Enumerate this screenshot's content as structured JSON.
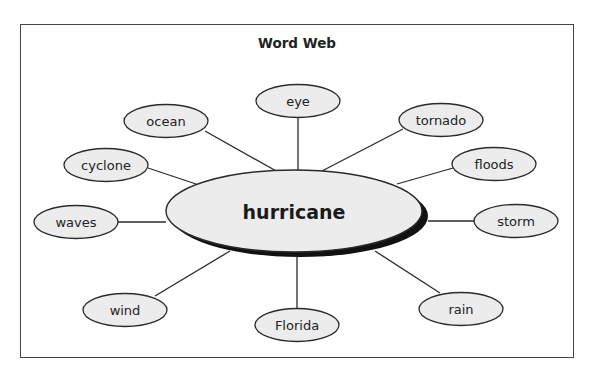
{
  "title": "Word Web",
  "center": {
    "label": "hurricane",
    "cx": 294,
    "cy": 211,
    "rx": 128,
    "ry": 41
  },
  "colors": {
    "fill": "#ececec",
    "stroke": "#2a2a2a",
    "shadow": "#111111",
    "frame": "#444444"
  },
  "nodes": [
    {
      "id": "eye",
      "label": "eye",
      "cx": 298,
      "cy": 101,
      "line": [
        298,
        117,
        298,
        170
      ]
    },
    {
      "id": "ocean",
      "label": "ocean",
      "cx": 166,
      "cy": 121,
      "line": [
        205,
        131,
        278,
        172
      ]
    },
    {
      "id": "tornado",
      "label": "tornado",
      "cx": 441,
      "cy": 120,
      "line": [
        403,
        129,
        320,
        172
      ]
    },
    {
      "id": "cyclone",
      "label": "cyclone",
      "cx": 106,
      "cy": 165,
      "line": [
        148,
        168,
        196,
        184
      ]
    },
    {
      "id": "floods",
      "label": "floods",
      "cx": 494,
      "cy": 164,
      "line": [
        453,
        168,
        397,
        184
      ]
    },
    {
      "id": "waves",
      "label": "waves",
      "cx": 76,
      "cy": 222,
      "line": [
        118,
        222,
        166,
        222
      ]
    },
    {
      "id": "storm",
      "label": "storm",
      "cx": 516,
      "cy": 221,
      "line": [
        474,
        221,
        428,
        221
      ]
    },
    {
      "id": "wind",
      "label": "wind",
      "cx": 125,
      "cy": 310,
      "line": [
        155,
        296,
        230,
        251
      ]
    },
    {
      "id": "florida",
      "label": "Florida",
      "cx": 297,
      "cy": 325,
      "line": [
        297,
        309,
        297,
        257
      ]
    },
    {
      "id": "rain",
      "label": "rain",
      "cx": 461,
      "cy": 309,
      "line": [
        440,
        293,
        375,
        251
      ]
    }
  ]
}
